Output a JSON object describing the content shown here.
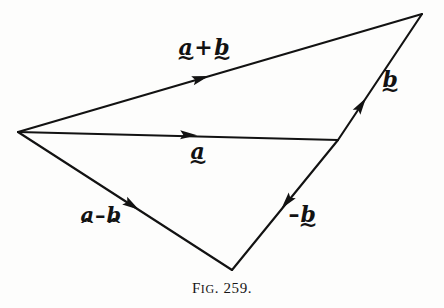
{
  "figure": {
    "caption_prefix": "F",
    "caption_smallcaps": "IG",
    "caption_number": ". 259.",
    "caption_full": "FIG. 259.",
    "background_color": "#fdfdfc",
    "ink_color": "#121212"
  },
  "diagram": {
    "type": "vector-diagram",
    "vertices": {
      "origin": {
        "x": 18,
        "y": 132,
        "name": "common-origin"
      },
      "tip_a": {
        "x": 338,
        "y": 140,
        "name": "tip-of-a"
      },
      "tip_a_plus_b": {
        "x": 422,
        "y": 14,
        "name": "tip-of-a-plus-b"
      },
      "tip_a_minus_b": {
        "x": 232,
        "y": 270,
        "name": "tip-of-a-minus-b"
      }
    },
    "vectors": [
      {
        "id": "a",
        "label": "a",
        "from": "origin",
        "to": "tip_a",
        "x1": 18,
        "y1": 132,
        "x2": 338,
        "y2": 140,
        "arrow_at": {
          "x": 190,
          "y": 135
        },
        "arrow_angle_deg": 1.4
      },
      {
        "id": "a_plus_b",
        "label": "a + b",
        "from": "origin",
        "to": "tip_a_plus_b",
        "x1": 18,
        "y1": 132,
        "x2": 422,
        "y2": 14,
        "arrow_at": {
          "x": 202,
          "y": 78
        },
        "arrow_angle_deg": -16.3
      },
      {
        "id": "b",
        "label": "b",
        "from": "tip_a",
        "to": "tip_a_plus_b",
        "x1": 338,
        "y1": 140,
        "x2": 422,
        "y2": 14,
        "arrow_at": {
          "x": 362,
          "y": 104
        },
        "arrow_angle_deg": -56.3
      },
      {
        "id": "minus_b",
        "label": "-b",
        "from": "tip_a",
        "to": "tip_a_minus_b",
        "x1": 338,
        "y1": 140,
        "x2": 232,
        "y2": 270,
        "arrow_at": {
          "x": 286,
          "y": 203
        },
        "arrow_angle_deg": 129.2
      },
      {
        "id": "a_minus_b",
        "label": "a - b",
        "from": "origin",
        "to": "tip_a_minus_b",
        "x1": 18,
        "y1": 132,
        "x2": 232,
        "y2": 270,
        "arrow_at": {
          "x": 133,
          "y": 206
        },
        "arrow_angle_deg": 32.8
      }
    ],
    "line_width": 2.1,
    "arrow_length": 17,
    "arrow_half_width": 4.6
  },
  "labels": {
    "a_plus_b": {
      "text": "a + b",
      "letter1": "a",
      "operator": "+",
      "letter2": "b",
      "mark1": "tilde",
      "mark2": "tilde"
    },
    "a": {
      "text": "a",
      "letter1": "a",
      "mark1": "tilde"
    },
    "b": {
      "text": "b",
      "letter1": "b",
      "mark1": "tilde"
    },
    "minus_b": {
      "text": "-b",
      "operator": "–",
      "letter1": "b",
      "mark1": "tilde"
    },
    "a_minus_b": {
      "text": "a - b",
      "letter1": "a",
      "operator": "–",
      "letter2": "b",
      "mark1": "caret",
      "mark2": "caret"
    }
  }
}
